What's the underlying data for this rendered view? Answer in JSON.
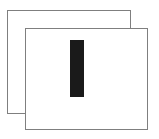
{
  "figure": {
    "background_color": "#ffffff",
    "width": 159,
    "height": 139,
    "shapes": [
      {
        "name": "back-rectangle",
        "type": "rectangle",
        "fill": "none",
        "stroke": "#7f7f7f",
        "stroke_width": 1,
        "x": 7,
        "y": 10,
        "width": 124,
        "height": 104
      },
      {
        "name": "front-rectangle",
        "type": "rectangle",
        "fill": "#ffffff",
        "stroke": "#7f7f7f",
        "stroke_width": 1,
        "x": 25,
        "y": 28,
        "width": 123,
        "height": 102
      },
      {
        "name": "vertical-bar",
        "type": "rectangle",
        "fill": "#1a1a1a",
        "stroke": "none",
        "stroke_width": 0,
        "x": 70,
        "y": 40,
        "width": 14,
        "height": 57
      }
    ]
  }
}
